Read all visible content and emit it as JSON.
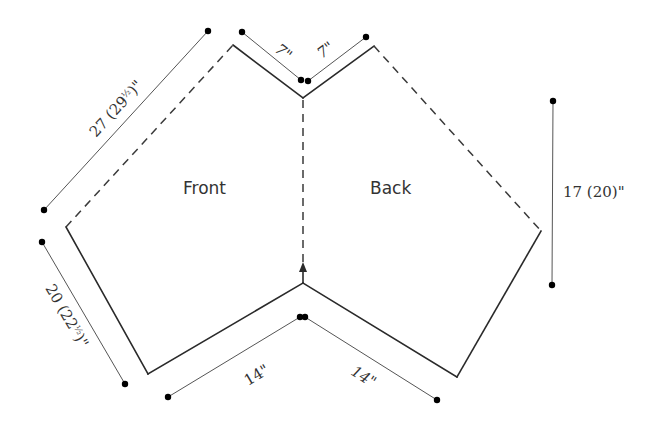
{
  "pieces": {
    "front_label": "Front",
    "back_label": "Back"
  },
  "measurements": {
    "front_length": {
      "main": "27 (29",
      "frac": "½",
      "end": ")\""
    },
    "front_side": {
      "main": "20 (22",
      "frac": "½",
      "end": ")\""
    },
    "back_height": "17 (20)\"",
    "shoulder_left": "7\"",
    "shoulder_right": "7\"",
    "bottom_left": "14\"",
    "bottom_right": "14\""
  },
  "colors": {
    "outline": "#2a2a2a",
    "dimension_line": "#555555",
    "text": "#333333",
    "background": "#ffffff"
  }
}
